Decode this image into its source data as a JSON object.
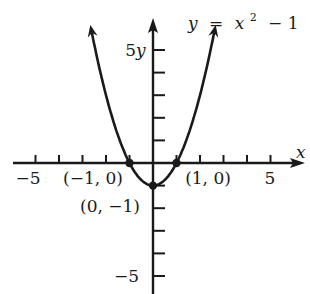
{
  "chart_data": {
    "type": "line",
    "title": "",
    "equation_label": "y = x² − 1",
    "equation": {
      "lhs": "y",
      "eq": "=",
      "base": "x",
      "exp": "2",
      "rest": "− 1"
    },
    "xlabel": "x",
    "ylabel": "y",
    "xlim": [
      -6,
      6
    ],
    "ylim": [
      -6,
      6
    ],
    "grid": false,
    "legend": "none",
    "x_tick_labels": [
      {
        "value": -5,
        "label": "−5"
      },
      {
        "value": 5,
        "label": "5"
      }
    ],
    "y_tick_labels": [
      {
        "value": 5,
        "label": "5"
      },
      {
        "value": -5,
        "label": "−5"
      }
    ],
    "series": [
      {
        "name": "y = x^2 - 1",
        "x": [
          -2.6,
          -2,
          -1.5,
          -1,
          -0.5,
          0,
          0.5,
          1,
          1.5,
          2,
          2.6
        ],
        "values": [
          5.76,
          3,
          1.25,
          0,
          -0.75,
          -1,
          -0.75,
          0,
          1.25,
          3,
          5.76
        ]
      }
    ],
    "annotations": [
      {
        "point": [
          -1,
          0
        ],
        "label": "(−1, 0)"
      },
      {
        "point": [
          1,
          0
        ],
        "label": "(1, 0)"
      },
      {
        "point": [
          0,
          -1
        ],
        "label": "(0, −1)"
      }
    ],
    "color": "#1a1a1a"
  }
}
